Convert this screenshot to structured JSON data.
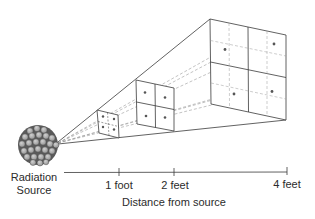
{
  "source": {
    "label_line1": "Radiation",
    "label_line2": "Source"
  },
  "axis": {
    "title": "Distance from source",
    "ticks": [
      {
        "label": "1 foot",
        "x": 119
      },
      {
        "label": "2 feet",
        "x": 174
      },
      {
        "label": "4 feet",
        "x": 287
      }
    ]
  },
  "panels": [
    {
      "distance": "1 foot",
      "grid": "2x2",
      "dots": 4
    },
    {
      "distance": "2 feet",
      "grid": "2x2",
      "dots": 4
    },
    {
      "distance": "4 feet",
      "grid": "2x2 with dashed subdivisions",
      "dots": 4
    }
  ],
  "colors": {
    "line": "#3a3a3a",
    "dashed": "#9a9a9a",
    "dot": "#555555",
    "text": "#2b2b2b"
  }
}
